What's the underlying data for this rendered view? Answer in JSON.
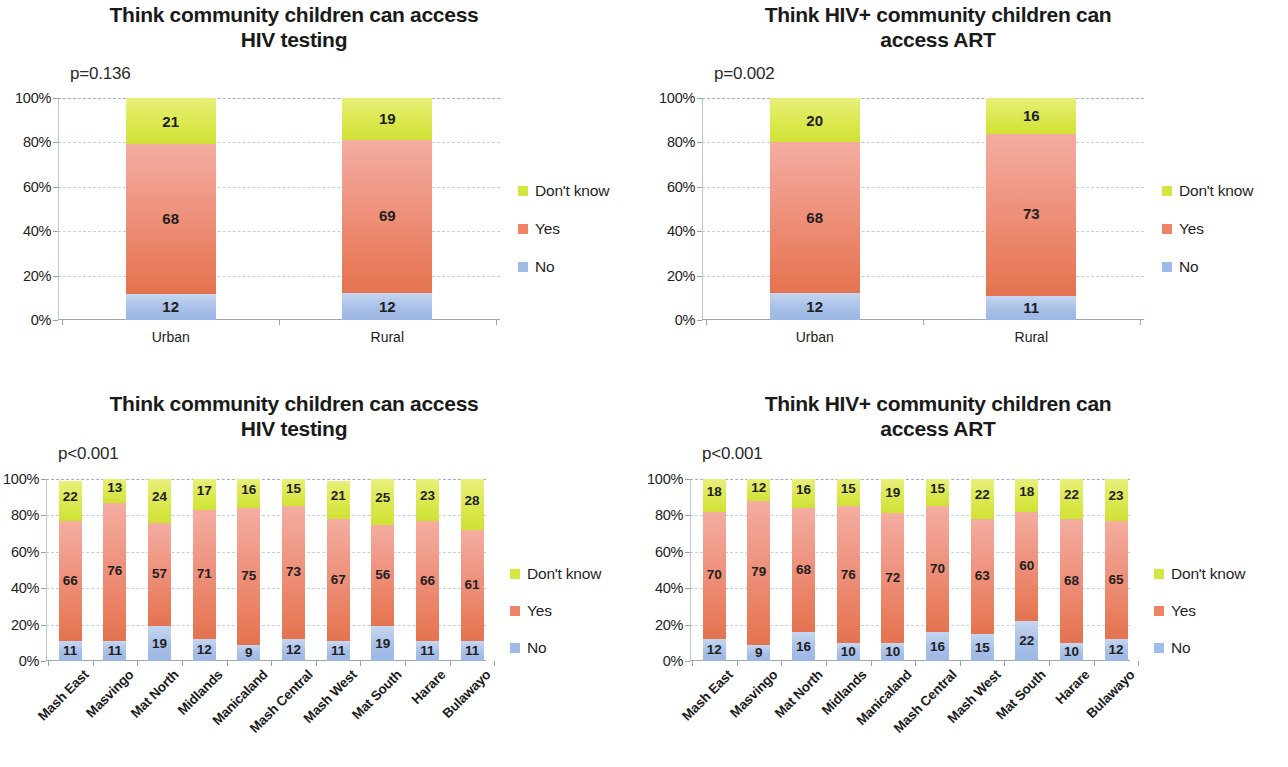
{
  "colors": {
    "dont_know": "#d4e63f",
    "yes": "#ef8366",
    "no": "#9fbbe8",
    "text": "#231f20",
    "gridline": "#c4cfda"
  },
  "legend": {
    "dont_know": "Don't know",
    "yes": "Yes",
    "no": "No"
  },
  "y_ticks": [
    "0%",
    "20%",
    "40%",
    "60%",
    "80%",
    "100%"
  ],
  "chart_data": [
    {
      "id": "testing-urban-rural",
      "type": "bar",
      "stacked": true,
      "title": "Think community children can access HIV testing",
      "title_line1": "Think community children can access",
      "title_line2": "HIV testing",
      "annotation": "p=0.136",
      "xlabel": "",
      "ylabel": "",
      "ylim": [
        0,
        100
      ],
      "ytick_labels": [
        "0%",
        "20%",
        "40%",
        "60%",
        "80%",
        "100%"
      ],
      "grid": true,
      "legend_position": "right",
      "categories": [
        "Urban",
        "Rural"
      ],
      "series": [
        {
          "name": "No",
          "color": "#9fbbe8",
          "values": [
            12,
            12
          ]
        },
        {
          "name": "Yes",
          "color": "#ef8366",
          "values": [
            68,
            69
          ]
        },
        {
          "name": "Don't know",
          "color": "#d4e63f",
          "values": [
            21,
            19
          ]
        }
      ]
    },
    {
      "id": "art-urban-rural",
      "type": "bar",
      "stacked": true,
      "title": "Think HIV+ community children can access ART",
      "title_line1": "Think HIV+ community children can",
      "title_line2": "access ART",
      "annotation": "p=0.002",
      "xlabel": "",
      "ylabel": "",
      "ylim": [
        0,
        100
      ],
      "ytick_labels": [
        "0%",
        "20%",
        "40%",
        "60%",
        "80%",
        "100%"
      ],
      "grid": true,
      "legend_position": "right",
      "categories": [
        "Urban",
        "Rural"
      ],
      "series": [
        {
          "name": "No",
          "color": "#9fbbe8",
          "values": [
            12,
            11
          ]
        },
        {
          "name": "Yes",
          "color": "#ef8366",
          "values": [
            68,
            73
          ]
        },
        {
          "name": "Don't know",
          "color": "#d4e63f",
          "values": [
            20,
            16
          ]
        }
      ]
    },
    {
      "id": "testing-provinces",
      "type": "bar",
      "stacked": true,
      "title": "Think community children can access HIV testing",
      "title_line1": "Think community children can access",
      "title_line2": "HIV testing",
      "annotation": "p<0.001",
      "xlabel": "",
      "ylabel": "",
      "ylim": [
        0,
        100
      ],
      "ytick_labels": [
        "0%",
        "20%",
        "40%",
        "60%",
        "80%",
        "100%"
      ],
      "grid": true,
      "legend_position": "right",
      "categories": [
        "Mash East",
        "Masvingo",
        "Mat North",
        "Midlands",
        "Manicaland",
        "Mash Central",
        "Mash West",
        "Mat South",
        "Harare",
        "Bulawayo"
      ],
      "series": [
        {
          "name": "No",
          "color": "#9fbbe8",
          "values": [
            11,
            11,
            19,
            12,
            9,
            12,
            11,
            19,
            11,
            11
          ]
        },
        {
          "name": "Yes",
          "color": "#ef8366",
          "values": [
            66,
            76,
            57,
            71,
            75,
            73,
            67,
            56,
            66,
            61
          ]
        },
        {
          "name": "Don't know",
          "color": "#d4e63f",
          "values": [
            22,
            13,
            24,
            17,
            16,
            15,
            21,
            25,
            23,
            28
          ]
        }
      ]
    },
    {
      "id": "art-provinces",
      "type": "bar",
      "stacked": true,
      "title": "Think HIV+ community children can access ART",
      "title_line1": "Think HIV+ community children can",
      "title_line2": "access ART",
      "annotation": "p<0.001",
      "xlabel": "",
      "ylabel": "",
      "ylim": [
        0,
        100
      ],
      "ytick_labels": [
        "0%",
        "20%",
        "40%",
        "60%",
        "80%",
        "100%"
      ],
      "grid": true,
      "legend_position": "right",
      "categories": [
        "Mash East",
        "Masvingo",
        "Mat North",
        "Midlands",
        "Manicaland",
        "Mash Central",
        "Mash West",
        "Mat South",
        "Harare",
        "Bulawayo"
      ],
      "series": [
        {
          "name": "No",
          "color": "#9fbbe8",
          "values": [
            12,
            9,
            16,
            10,
            10,
            16,
            15,
            22,
            10,
            12
          ]
        },
        {
          "name": "Yes",
          "color": "#ef8366",
          "values": [
            70,
            79,
            68,
            76,
            72,
            70,
            63,
            60,
            68,
            65
          ]
        },
        {
          "name": "Don't know",
          "color": "#d4e63f",
          "values": [
            18,
            12,
            16,
            15,
            19,
            15,
            22,
            18,
            22,
            23
          ]
        }
      ]
    }
  ]
}
